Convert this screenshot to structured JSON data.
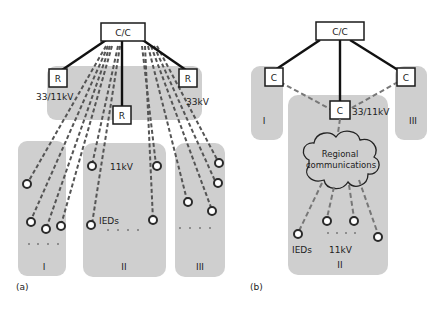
{
  "diagram_a": {
    "caption": "(a)",
    "control_center": "C/C",
    "relay_label": "R",
    "labels": {
      "left_voltage": "33/11kV",
      "right_voltage": "33kV",
      "region_ii_voltage": "11kV",
      "ieds": "IEDs"
    },
    "regions": [
      "I",
      "II",
      "III"
    ]
  },
  "diagram_b": {
    "caption": "(b)",
    "control_center": "C/C",
    "concentrator_label": "C",
    "labels": {
      "center_voltage": "33/11kV",
      "cloud_line1": "Regional",
      "cloud_line2": "communications",
      "ieds": "IEDs",
      "region_ii_voltage": "11kV"
    },
    "regions": [
      "I",
      "II",
      "III"
    ]
  },
  "colors": {
    "region_fill": "#cfcfcf",
    "line": "#111111",
    "dashed": "#555555"
  }
}
